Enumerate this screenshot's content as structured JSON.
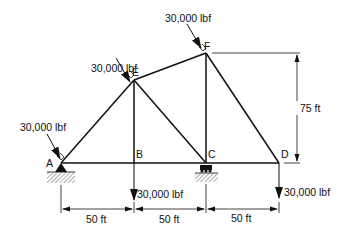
{
  "diagram": {
    "type": "truss",
    "nodes": [
      {
        "id": "A",
        "label": "A",
        "x": 61,
        "y": 163
      },
      {
        "id": "B",
        "label": "B",
        "x": 134,
        "y": 163
      },
      {
        "id": "C",
        "label": "C",
        "x": 206,
        "y": 163
      },
      {
        "id": "D",
        "label": "D",
        "x": 279,
        "y": 163
      },
      {
        "id": "E",
        "label": "E",
        "x": 134,
        "y": 80
      },
      {
        "id": "F",
        "label": "F",
        "x": 206,
        "y": 53
      }
    ],
    "members": [
      [
        "A",
        "B"
      ],
      [
        "B",
        "C"
      ],
      [
        "C",
        "D"
      ],
      [
        "A",
        "E"
      ],
      [
        "E",
        "F"
      ],
      [
        "F",
        "D"
      ],
      [
        "E",
        "B"
      ],
      [
        "E",
        "C"
      ],
      [
        "F",
        "C"
      ]
    ],
    "supports": [
      {
        "node": "A",
        "type": "pin"
      },
      {
        "node": "C",
        "type": "roller"
      }
    ],
    "loads": {
      "A": {
        "label": "30,000 lbf",
        "direction": "perpendicular-to-AF"
      },
      "E": {
        "label": "30,000 lbf",
        "direction": "perpendicular-to-AF"
      },
      "F": {
        "label": "30,000 lbf",
        "direction": "perpendicular-to-AF"
      },
      "B": {
        "label": "30,000 lbf",
        "direction": "down"
      },
      "D": {
        "label": "30,000 lbf",
        "direction": "down"
      }
    },
    "dimensions": {
      "height": {
        "label": "75 ft"
      },
      "spans": [
        {
          "label": "50 ft"
        },
        {
          "label": "50 ft"
        },
        {
          "label": "50 ft"
        }
      ]
    }
  }
}
